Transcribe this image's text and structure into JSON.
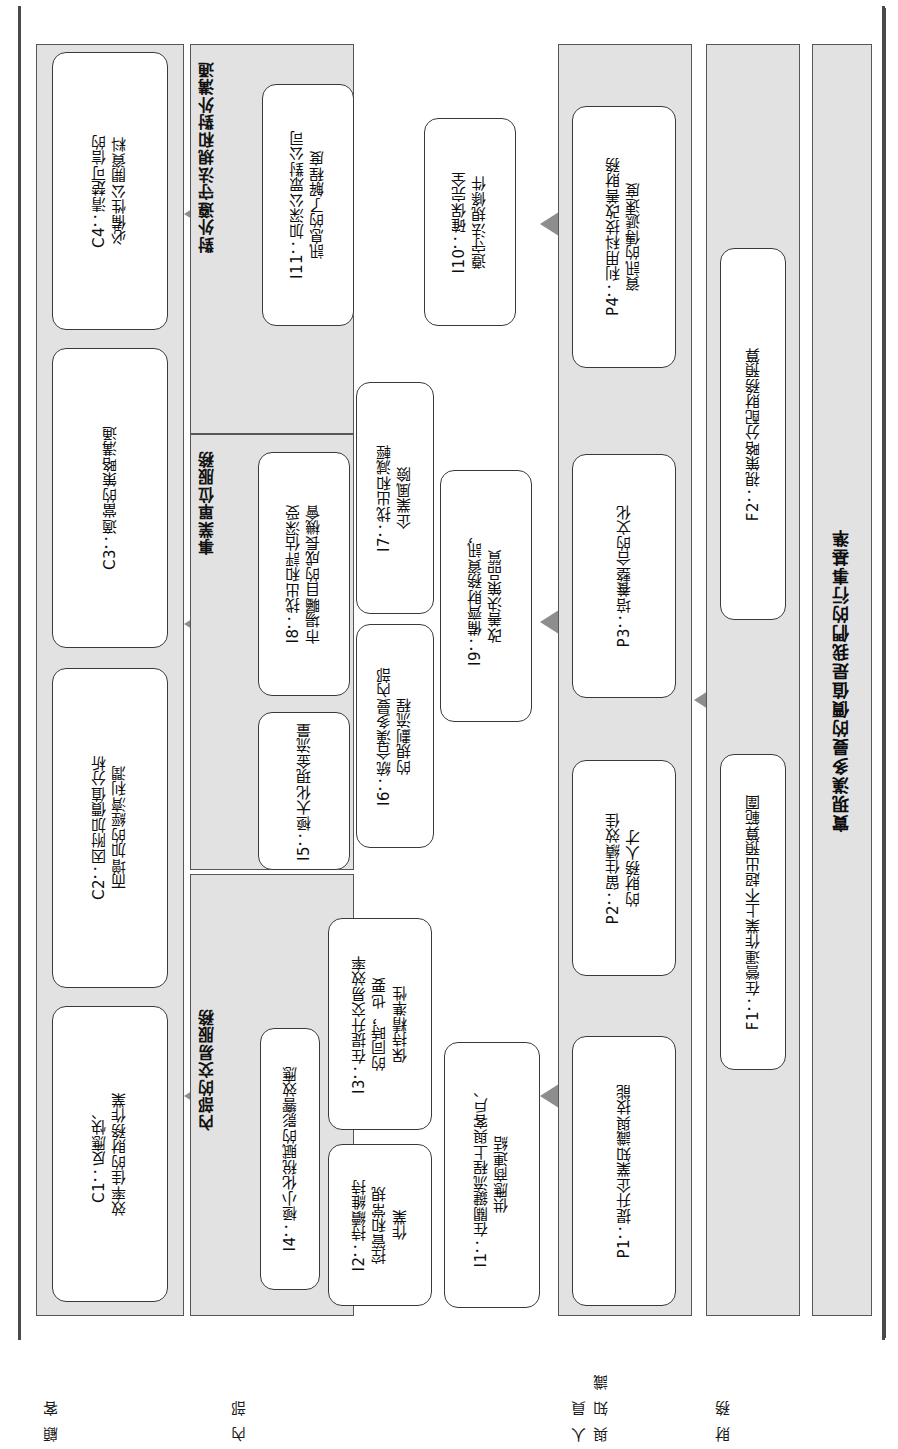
{
  "diagram": {
    "kind": "strategy-map",
    "bottom_banner": "實現漢多曼的價值是我們的行事基準",
    "colors": {
      "group_fill": "#e2e2e2",
      "node_fill": "#ffffff",
      "border": "#545454",
      "arrow": "#8f8f8f",
      "text": "#111111"
    }
  },
  "row_labels": {
    "customer": "顧 客",
    "internal": "內 部",
    "people": "人 員\n與 知 識",
    "finance": "財 務"
  },
  "group_titles": {
    "external_compliance": "對外遵守法規和對外溝通",
    "business_unit_service": "事業單位服務",
    "internal_transaction_service": "內部的交易服務"
  },
  "nodes": {
    "c1": "C1：反應快、\n效率佳的財務作業",
    "c2": "C2：因附加價值分析\n而增加的經濟利潤",
    "c3": "C3：適當的策略溝通",
    "c4": "C4：清楚可信的\n必備性公開資料",
    "i1": "I1：在關鍵流程上與客戶、\n供應商連結",
    "i2": "I2：持續維持\n控管和常規\n作業",
    "i3": "I3：在提升交易效率\n的同時，也要\n保持精準性",
    "i4": "I4：極小化稅賦的影響效應",
    "i5": "I5：極大化現金流量",
    "i6": "I6：統合漢多曼內部\n的規劃流程",
    "i7": "I7：找出和減輕\n企業風險",
    "i8": "I8：找出和評估深受\n市場矚目的成長機會",
    "i9": "I9：備齊財務資訊，\n改善決策品質",
    "i10": "I10：確保完全\n遵守法規條件",
    "i11": "I11：加深公眾對公司\n訊息的了解程度",
    "p1": "P1：提升企業知識與技能",
    "p2": "P2：留住績效佳\n的財務人才",
    "p3": "P3：培養整合的文化",
    "p4": "P4：利用科技改善財務\n資訊的傳遞速度",
    "f1": "F1：在營運作業上不超出預算範圍",
    "f2": "F2：視策略分配財務預算"
  }
}
